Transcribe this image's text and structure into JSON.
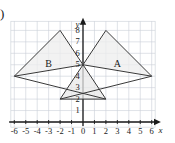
{
  "figure": {
    "question_marker": ")",
    "width": 175,
    "height": 143
  },
  "axes": {
    "x_label": "x",
    "y_label": "y",
    "x_ticks": [
      "-6",
      "-5",
      "-4",
      "-3",
      "-2",
      "-1",
      "0",
      "1",
      "2",
      "3",
      "4",
      "5",
      "6"
    ],
    "y_ticks": [
      "1",
      "2",
      "3",
      "4",
      "5",
      "6",
      "7",
      "8"
    ],
    "x_min": -6,
    "x_max": 6,
    "y_min": 0,
    "y_max": 8,
    "grid": true,
    "grid_color": "#c9cfd6",
    "axis_color": "#1a1a1a"
  },
  "chart_data": {
    "type": "scatter",
    "title": "",
    "xlabel": "x",
    "ylabel": "y",
    "xlim": [
      -6,
      6
    ],
    "ylim": [
      0,
      8
    ],
    "grid": true,
    "shapes": [
      {
        "name": "A",
        "label": "A",
        "label_at": [
          3,
          5
        ],
        "vertices": [
          [
            2,
            8
          ],
          [
            6,
            4
          ],
          [
            0,
            5
          ]
        ],
        "fill": "#ededed",
        "stroke": "#3a3a3a"
      },
      {
        "name": "B",
        "label": "B",
        "label_at": [
          -3,
          5
        ],
        "vertices": [
          [
            -2,
            8
          ],
          [
            -6,
            4
          ],
          [
            0,
            5
          ]
        ],
        "fill": "#ededed",
        "stroke": "#3a3a3a"
      },
      {
        "name": "C",
        "label": "",
        "label_at": null,
        "vertices": [
          [
            0,
            5
          ],
          [
            -2,
            2
          ],
          [
            2,
            2
          ]
        ],
        "fill": "#e8e8e8",
        "stroke": "#3a3a3a"
      }
    ],
    "extra_segments": [
      {
        "from": [
          -6,
          4
        ],
        "to": [
          2,
          2
        ]
      },
      {
        "from": [
          6,
          4
        ],
        "to": [
          -2,
          2
        ]
      }
    ]
  },
  "labels": {
    "shape_a": "A",
    "shape_b": "B"
  },
  "colors": {
    "background": "#ffffff",
    "grid": "#c9cfd6",
    "axis": "#1a1a1a",
    "shape_stroke": "#3a3a3a",
    "shape_fill": "#ededed"
  }
}
